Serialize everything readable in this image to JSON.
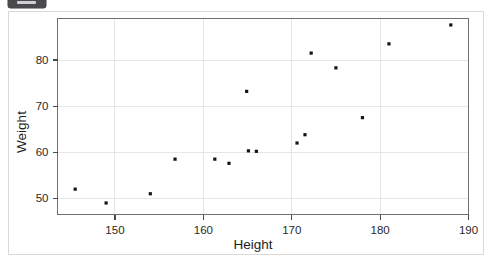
{
  "badge": {
    "name": "corner-badge",
    "color": "#4a4a4c"
  },
  "chart_data": {
    "type": "scatter",
    "title": "",
    "xlabel": "Height",
    "ylabel": "Weight",
    "xlim": [
      143.5,
      190
    ],
    "ylim": [
      46.5,
      89
    ],
    "xticks": [
      150,
      160,
      170,
      180,
      190
    ],
    "yticks": [
      50,
      60,
      70,
      80
    ],
    "xtick_labels": [
      "150",
      "160",
      "170",
      "180",
      "190"
    ],
    "ytick_labels": [
      "50",
      "60",
      "70",
      "80"
    ],
    "grid": true,
    "legend": null,
    "marker_color": "#141414",
    "marker_size": 3.2,
    "points": [
      {
        "x": 145.5,
        "y": 52.0
      },
      {
        "x": 149.0,
        "y": 49.0
      },
      {
        "x": 154.0,
        "y": 51.0
      },
      {
        "x": 156.8,
        "y": 58.5
      },
      {
        "x": 161.3,
        "y": 58.5
      },
      {
        "x": 162.9,
        "y": 57.6
      },
      {
        "x": 164.9,
        "y": 73.2
      },
      {
        "x": 165.1,
        "y": 60.3
      },
      {
        "x": 166.0,
        "y": 60.2
      },
      {
        "x": 170.6,
        "y": 62.0
      },
      {
        "x": 171.5,
        "y": 63.8
      },
      {
        "x": 172.2,
        "y": 81.5
      },
      {
        "x": 175.0,
        "y": 78.3
      },
      {
        "x": 178.0,
        "y": 67.5
      },
      {
        "x": 181.0,
        "y": 83.5
      },
      {
        "x": 188.0,
        "y": 87.6
      }
    ]
  }
}
